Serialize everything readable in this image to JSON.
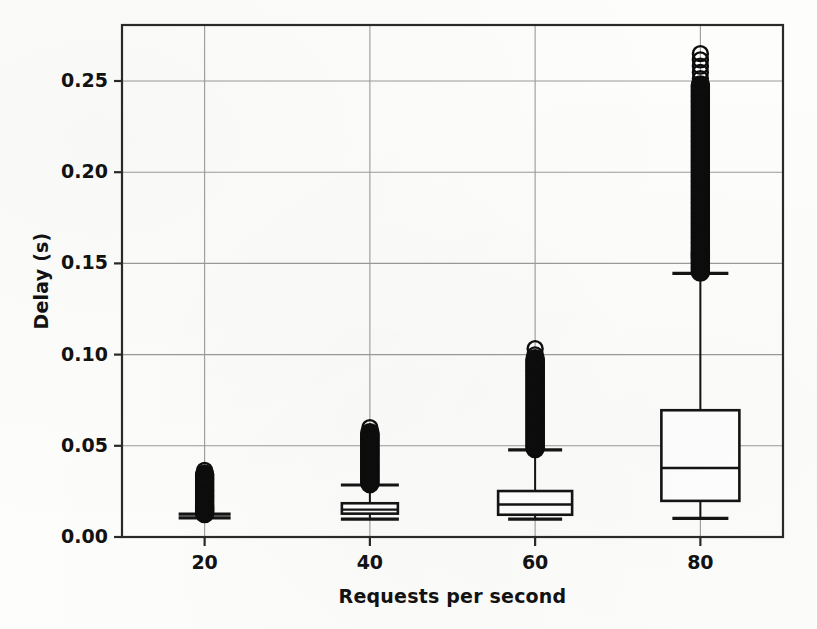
{
  "chart_data": {
    "type": "box",
    "title": "",
    "xlabel": "Requests per second",
    "ylabel": "Delay (s)",
    "categories": [
      "20",
      "40",
      "60",
      "80"
    ],
    "xlim": [
      10,
      90
    ],
    "ylim": [
      -0.008,
      0.281
    ],
    "yticks": [
      "0.00",
      "0.05",
      "0.10",
      "0.15",
      "0.20",
      "0.25"
    ],
    "ytick_values": [
      0.0,
      0.05,
      0.1,
      0.15,
      0.2,
      0.25
    ],
    "xticks": [
      "20",
      "40",
      "60",
      "80"
    ],
    "xtick_values": [
      20,
      40,
      60,
      80
    ],
    "grid": true,
    "legend": "none",
    "boxes": [
      {
        "category": "20",
        "x": 20,
        "whisker_low": 0.0105,
        "q1": 0.0108,
        "median": 0.0112,
        "q3": 0.0118,
        "whisker_high": 0.0125,
        "outlier_min": 0.0128,
        "outlier_max": 0.0385,
        "outlier_density": "very-dense"
      },
      {
        "category": "40",
        "x": 40,
        "whisker_low": 0.0098,
        "q1": 0.0128,
        "median": 0.015,
        "q3": 0.0185,
        "whisker_high": 0.0285,
        "outlier_min": 0.0292,
        "outlier_max": 0.062,
        "outlier_density": "very-dense"
      },
      {
        "category": "60",
        "x": 60,
        "whisker_low": 0.0098,
        "q1": 0.0122,
        "median": 0.0178,
        "q3": 0.0252,
        "whisker_high": 0.0478,
        "outlier_min": 0.0485,
        "outlier_max": 0.106,
        "outlier_density": "very-dense"
      },
      {
        "category": "80",
        "x": 80,
        "whisker_low": 0.0102,
        "q1": 0.0198,
        "median": 0.0378,
        "q3": 0.0695,
        "whisker_high": 0.1445,
        "outlier_min": 0.1452,
        "outlier_max": 0.265,
        "outlier_density": "very-dense"
      }
    ],
    "colors": {
      "line": "#141414",
      "grid": "#9a9a9a",
      "frame": "#2a2a2a",
      "background": "#fdfdfc",
      "outlier": "#0d0d0d"
    }
  }
}
